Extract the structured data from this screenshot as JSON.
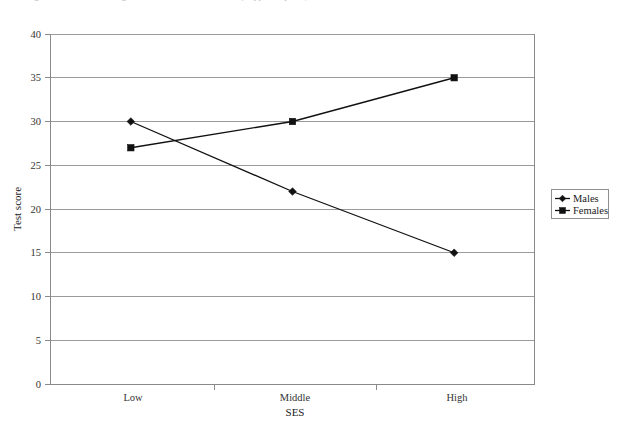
{
  "figure": {
    "caption_fragment": "Figure 1.  Interaction of gender and SES on test score (clipped caption)",
    "background": "#ffffff"
  },
  "chart_data": {
    "type": "line",
    "title": "",
    "xlabel": "SES",
    "ylabel": "Test score",
    "categories": [
      "Low",
      "Middle",
      "High"
    ],
    "series": [
      {
        "name": "Males",
        "marker": "diamond",
        "color": "#111111",
        "values": [
          30,
          22,
          15
        ]
      },
      {
        "name": "Females",
        "marker": "square",
        "color": "#111111",
        "values": [
          27,
          30,
          35
        ]
      }
    ],
    "ylim": [
      0,
      40
    ],
    "ytick_step": 5,
    "yticks": [
      "0",
      "5",
      "10",
      "15",
      "20",
      "25",
      "30",
      "35",
      "40"
    ],
    "grid": "horizontal",
    "legend_position": "right",
    "legend_entries": [
      "Males",
      "Females"
    ]
  },
  "axes": {
    "y_label": "Test score",
    "x_label": "SES",
    "y_tick_0": "0",
    "y_tick_1": "5",
    "y_tick_2": "10",
    "y_tick_3": "15",
    "y_tick_4": "20",
    "y_tick_5": "25",
    "y_tick_6": "30",
    "y_tick_7": "35",
    "y_tick_8": "40",
    "x_tick_0": "Low",
    "x_tick_1": "Middle",
    "x_tick_2": "High"
  },
  "legend": {
    "item_0": "Males",
    "item_1": "Females"
  },
  "colors": {
    "series": "#111111",
    "gridline": "#9a9a9a",
    "frame": "#9a9a9a",
    "text": "#1a1a1a"
  }
}
